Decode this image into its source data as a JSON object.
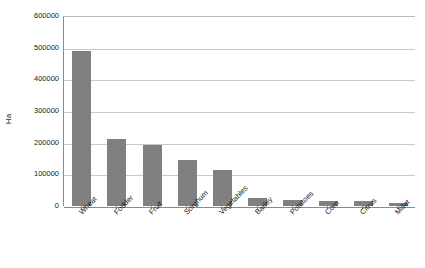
{
  "chart_data": {
    "type": "bar",
    "title": "",
    "xlabel": "",
    "ylabel": "Ha",
    "categories": [
      "Wheat",
      "Fodder",
      "Fruit",
      "Sorghum",
      "Vegetables",
      "Barley",
      "Potatoes",
      "Corn",
      "Citrus",
      "Millet"
    ],
    "values": [
      490000,
      212000,
      192000,
      145000,
      113000,
      25000,
      20000,
      17000,
      16000,
      8000
    ],
    "ylim": [
      0,
      600000
    ],
    "ytick_labels": [
      "600000",
      "500000",
      "400000",
      "300000",
      "200000",
      "100000",
      "0"
    ],
    "ytick_values": [
      600000,
      500000,
      400000,
      300000,
      200000,
      100000,
      0
    ],
    "grid": true,
    "legend": false,
    "legend_position": "none",
    "bar_color": "#808080",
    "gridline_color": "#c9c9c9",
    "axis_color": "#8a8a8a",
    "background_color": "#ffffff"
  }
}
